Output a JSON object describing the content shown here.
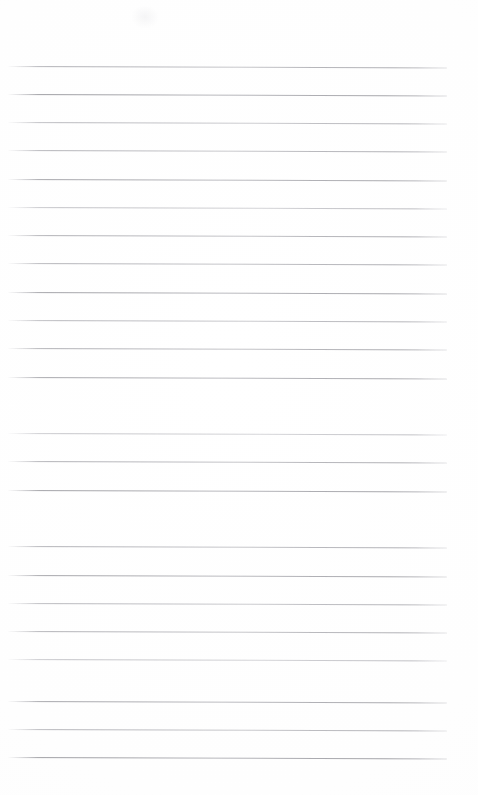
{
  "document": {
    "kind": "scanned-blank-lined-paper",
    "orientation": "portrait",
    "page_width_px": 478,
    "page_height_px": 795,
    "background_color": "#fefefe",
    "visible_text": "",
    "handwriting_present": false,
    "margin_rule_present": false,
    "holes_present": false,
    "header_present": false,
    "footer_present": false
  },
  "rules": {
    "count": 25,
    "left_x": 8,
    "right_x": 447,
    "first_y": 66,
    "last_y": 757,
    "spacing_px": 28.4,
    "thickness_px": 1,
    "skew_deg": 0.18,
    "color_dark": "#a6a6ab",
    "color_mid": "#bcbcc1",
    "color_light": "#d4d4d8",
    "lines": [
      {
        "y": 66,
        "x1": 8,
        "x2": 447,
        "skew": 0.2,
        "opacity": 0.92,
        "tone": "mid",
        "gradient": "linear-gradient(to right, #c9c9cd 0%, #adadb2 10%, #b4b4b9 34%, #c3c3c7 52%, #b0b0b5 70%, #a9a9ae 88%, #c6c6ca 100%)"
      },
      {
        "y": 94,
        "x1": 8,
        "x2": 447,
        "skew": 0.18,
        "opacity": 0.96,
        "tone": "dark",
        "gradient": "linear-gradient(to right, #b8b8bd 0%, #9c9ca1 8%, #a5a5aa 30%, #b6b6bb 46%, #aeaeb3 64%, #a3a3a8 86%, #c2c2c6 100%)"
      },
      {
        "y": 122,
        "x1": 8,
        "x2": 447,
        "skew": 0.19,
        "opacity": 0.88,
        "tone": "mid",
        "gradient": "linear-gradient(to right, #cbcbcf 0%, #b3b3b8 12%, #bababf 36%, #c7c7cb 56%, #b5b5ba 74%, #aeaeb3 90%, #cfcfd3 100%)"
      },
      {
        "y": 150,
        "x1": 8,
        "x2": 447,
        "skew": 0.2,
        "opacity": 0.9,
        "tone": "mid",
        "gradient": "linear-gradient(to right, #c7c7cb 0%, #aeaeb3 10%, #b7b7bc 32%, #c4c4c8 50%, #b1b1b6 72%, #aaaaaf 88%, #c8c8cc 100%)"
      },
      {
        "y": 179,
        "x1": 8,
        "x2": 447,
        "skew": 0.18,
        "opacity": 0.94,
        "tone": "dark",
        "gradient": "linear-gradient(to right, #bdbdc2 0%, #a2a2a7 9%, #aaaaaf 30%, #b9b9be 48%, #aeaeb3 68%, #a5a5aa 86%, #c4c4c8 100%)"
      },
      {
        "y": 207,
        "x1": 8,
        "x2": 447,
        "skew": 0.19,
        "opacity": 0.86,
        "tone": "light",
        "gradient": "linear-gradient(to right, #d2d2d6 0%, #bababf 12%, #c2c2c6 38%, #cdcdd1 58%, #bcbcc1 76%, #b4b4b9 92%, #d6d6da 100%)"
      },
      {
        "y": 235,
        "x1": 8,
        "x2": 447,
        "skew": 0.2,
        "opacity": 0.92,
        "tone": "mid",
        "gradient": "linear-gradient(to right, #c6c6ca 0%, #acacb1 10%, #b5b5ba 34%, #c1c1c5 54%, #b0b0b5 72%, #a8a8ad 90%, #c9c9cd 100%)"
      },
      {
        "y": 263,
        "x1": 8,
        "x2": 447,
        "skew": 0.18,
        "opacity": 0.9,
        "tone": "mid",
        "gradient": "linear-gradient(to right, #c8c8cc 0%, #aeaeb3 11%, #b6b6bb 33%, #c0c0c4 50%, #b2b2b7 70%, #a9a9ae 88%, #cbcbcf 100%)"
      },
      {
        "y": 292,
        "x1": 8,
        "x2": 447,
        "skew": 0.19,
        "opacity": 0.94,
        "tone": "dark",
        "gradient": "linear-gradient(to right, #bbbbc0 0%, #a0a0a5 9%, #a8a8ad 31%, #b7b7bc 49%, #acacb1 68%, #a3a3a8 87%, #c3c3c7 100%)"
      },
      {
        "y": 320,
        "x1": 8,
        "x2": 447,
        "skew": 0.2,
        "opacity": 0.88,
        "tone": "mid",
        "gradient": "linear-gradient(to right, #cacace 0%, #b1b1b6 12%, #b9b9be 36%, #c5c5c9 55%, #b4b4b9 73%, #acacb1 90%, #cdcdd1 100%)"
      },
      {
        "y": 348,
        "x1": 8,
        "x2": 447,
        "skew": 0.18,
        "opacity": 0.91,
        "tone": "mid",
        "gradient": "linear-gradient(to right, #c5c5c9 0%, #ababb0 10%, #b4b4b9 33%, #c0c0c4 52%, #afafb4 71%, #a7a7ac 89%, #c8c8cc 100%)"
      },
      {
        "y": 377,
        "x1": 8,
        "x2": 447,
        "skew": 0.19,
        "opacity": 0.93,
        "tone": "dark",
        "gradient": "linear-gradient(to right, #bebec3 0%, #a3a3a8 9%, #ababb0 30%, #b8b8bd 48%, #adadb2 69%, #a4a4a9 87%, #c4c4c8 100%)"
      },
      {
        "y": 405,
        "x1": 8,
        "x2": 447,
        "skew": 0.2,
        "opacity": 0.89,
        "tone": "mid",
        "gradient": "linear-gradient(to right, #c9c9cd 0%, #b0b0b5 11%, #b8b8bd 35%, #c4c4c8 54%, #b3b3b8 72%, #abab b0 90%, #ccccd0 100%)"
      },
      {
        "y": 433,
        "x1": 8,
        "x2": 447,
        "skew": 0.18,
        "opacity": 0.84,
        "tone": "light",
        "gradient": "linear-gradient(to right, #d5d5d9 0%, #bdbdc2 13%, #c4c4c8 38%, #cfcfd3 58%, #bfbfc4 77%, #b7b7bc 92%, #d8d8dc 100%)"
      },
      {
        "y": 461,
        "x1": 8,
        "x2": 447,
        "skew": 0.19,
        "opacity": 0.92,
        "tone": "mid",
        "gradient": "linear-gradient(to right, #c6c6ca 0%, #adadb2 10%, #b5b5ba 34%, #c1c1c5 53%, #b1b1b6 71%, #a9a9ae 89%, #c9c9cd 100%)"
      },
      {
        "y": 490,
        "x1": 8,
        "x2": 447,
        "skew": 0.2,
        "opacity": 0.95,
        "tone": "dark",
        "gradient": "linear-gradient(to right, #bababf 0%, #9f9fa4 8%, #a7a7ac 30%, #b6b6bb 47%, #ababb0 67%, #a2a2a7 86%, #c2c2c6 100%)"
      },
      {
        "y": 518,
        "x1": 8,
        "x2": 447,
        "skew": 0.18,
        "opacity": 0.87,
        "tone": "mid",
        "gradient": "linear-gradient(to right, #cbcbcf 0%, #b2b2b7 12%, #babab f 36%, #c6c6ca 56%, #b5b5ba 74%, #adadb2 90%, #cecED2 100%)"
      },
      {
        "y": 546,
        "x1": 8,
        "x2": 447,
        "skew": 0.19,
        "opacity": 0.91,
        "tone": "mid",
        "gradient": "linear-gradient(to right, #c7c7cb 0%, #adadb2 10%, #b6b6bb 33%, #c2c2c6 52%, #b2b2b7 71%, #aaaaaf 89%, #cacace 100%)"
      },
      {
        "y": 575,
        "x1": 8,
        "x2": 447,
        "skew": 0.2,
        "opacity": 0.93,
        "tone": "dark",
        "gradient": "linear-gradient(to right, #bcbcc1 0%, #a1a1a6 9%, #a9a9ae 31%, #b7b7bc 49%, #acacb1 68%, #a3a3a8 87%, #c3c3c7 100%)"
      },
      {
        "y": 603,
        "x1": 8,
        "x2": 447,
        "skew": 0.18,
        "opacity": 0.88,
        "tone": "mid",
        "gradient": "linear-gradient(to right, #cacace 0%, #b1b1b6 11%, #b9b9be 35%, #c5c5c9 55%, #b4b4b9 73%, #acacb1 90%, #cdcdd1 100%)"
      },
      {
        "y": 631,
        "x1": 8,
        "x2": 447,
        "skew": 0.19,
        "opacity": 0.9,
        "tone": "mid",
        "gradient": "linear-gradient(to right, #c6c6ca 0%, #acacb1 10%, #b5b5ba 34%, #c1c1c5 53%, #b1b1b6 72%, #a9a9ae 89%, #c9c9cd 100%)"
      },
      {
        "y": 659,
        "x1": 8,
        "x2": 447,
        "skew": 0.2,
        "opacity": 0.85,
        "tone": "light",
        "gradient": "linear-gradient(to right, #d3d3d7 0%, #bbbbc0 13%, #c3c3c7 38%, #cecED2 58%, #bebec3 77%, #b6b6bb 92%, #d7d7db 100%)"
      },
      {
        "y": 701,
        "x1": 8,
        "x2": 447,
        "skew": 0.18,
        "opacity": 0.93,
        "tone": "dark",
        "gradient": "linear-gradient(to right, #bdbdc2 0%, #a2a2a7 9%, #aaaaaf 30%, #b8b8bd 48%, #adadb2 68%, #a4a4a9 87%, #c4c4c8 100%)"
      },
      {
        "y": 729,
        "x1": 8,
        "x2": 447,
        "skew": 0.19,
        "opacity": 0.89,
        "tone": "mid",
        "gradient": "linear-gradient(to right, #c8c8cc 0%, #afafb4 11%, #b7b7bc 35%, #c3c3c7 54%, #b3b3b8 72%, #ababb0 90%, #cbcbcf 100%)"
      },
      {
        "y": 757,
        "x1": 8,
        "x2": 447,
        "skew": 0.2,
        "opacity": 0.96,
        "tone": "dark",
        "gradient": "linear-gradient(to right, #b8b8bd 0%, #9d9da2 8%, #a5a5aa 29%, #b4b4b9 47%, #a9a9ae 67%, #a0a0a5 86%, #c1c1c5 100%)"
      }
    ]
  }
}
